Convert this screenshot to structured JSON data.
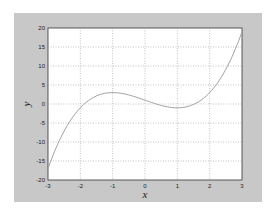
{
  "chart_data": {
    "type": "line",
    "title": "",
    "xlabel": "x",
    "ylabel": "y",
    "xlim": [
      -3,
      3
    ],
    "ylim": [
      -20,
      20
    ],
    "grid": true,
    "xticks": [
      -3,
      -2,
      -1,
      0,
      1,
      2,
      3
    ],
    "yticks": [
      -20,
      -15,
      -10,
      -5,
      0,
      5,
      10,
      15,
      20
    ],
    "series": [
      {
        "name": "y = x^3 - 3x + 1",
        "x": [
          -3,
          -2.5,
          -2,
          -1.5,
          -1,
          -0.5,
          0,
          0.5,
          1,
          1.5,
          2,
          2.5,
          3
        ],
        "values": [
          -17,
          -7.125,
          -1,
          2.125,
          3,
          2.375,
          1,
          -0.375,
          -1,
          -0.125,
          3,
          9.125,
          19
        ]
      }
    ],
    "colors": {
      "figure_bg": "#c8c8c8",
      "plot_bg": "#ffffff",
      "line": "#a0a0a0",
      "grid": "#9a9a9a"
    }
  }
}
